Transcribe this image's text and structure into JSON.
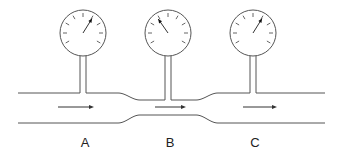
{
  "diagram": {
    "colors": {
      "line": "#555555",
      "arrow": "#333333",
      "label": "#222222",
      "background": "#ffffff"
    },
    "pipe": {
      "wide_top_y": 93,
      "wide_bottom_y": 123,
      "narrow_top_y": 100,
      "narrow_bottom_y": 115,
      "left_x": 18,
      "right_x": 325,
      "constriction_start_x": 118,
      "constriction_end_x": 218
    },
    "gauges": [
      {
        "id": "A",
        "cx": 83,
        "cy": 33,
        "r": 23,
        "needle_angle_deg": 32,
        "reading": "high"
      },
      {
        "id": "B",
        "cx": 168,
        "cy": 33,
        "r": 23,
        "needle_angle_deg": -35,
        "reading": "low"
      },
      {
        "id": "C",
        "cx": 253,
        "cy": 33,
        "r": 23,
        "needle_angle_deg": 32,
        "reading": "high"
      }
    ],
    "flow_arrows": [
      {
        "x1": 58,
        "x2": 94,
        "y": 107
      },
      {
        "x1": 155,
        "x2": 186,
        "y": 107
      },
      {
        "x1": 243,
        "x2": 277,
        "y": 107
      }
    ],
    "labels": [
      {
        "text": "A",
        "x": 85,
        "y": 136
      },
      {
        "text": "B",
        "x": 170,
        "y": 136
      },
      {
        "text": "C",
        "x": 255,
        "y": 136
      }
    ]
  }
}
